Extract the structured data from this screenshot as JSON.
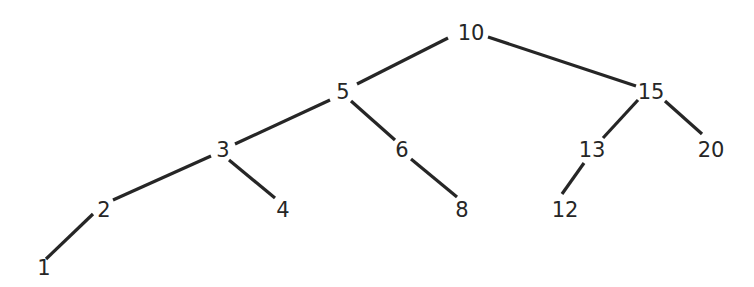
{
  "diagram": {
    "type": "binary-search-tree",
    "colors": {
      "stroke": "#262626",
      "text": "#262626",
      "background": "#ffffff"
    },
    "nodes": [
      {
        "id": "n10",
        "label": "10",
        "x": 471,
        "y": 33
      },
      {
        "id": "n5",
        "label": "5",
        "x": 343,
        "y": 92
      },
      {
        "id": "n15",
        "label": "15",
        "x": 651,
        "y": 92
      },
      {
        "id": "n3",
        "label": "3",
        "x": 223,
        "y": 150
      },
      {
        "id": "n6",
        "label": "6",
        "x": 402,
        "y": 150
      },
      {
        "id": "n13",
        "label": "13",
        "x": 592,
        "y": 150
      },
      {
        "id": "n20",
        "label": "20",
        "x": 711,
        "y": 150
      },
      {
        "id": "n2",
        "label": "2",
        "x": 104,
        "y": 210
      },
      {
        "id": "n4",
        "label": "4",
        "x": 283,
        "y": 210
      },
      {
        "id": "n8",
        "label": "8",
        "x": 462,
        "y": 210
      },
      {
        "id": "n12",
        "label": "12",
        "x": 565,
        "y": 210
      },
      {
        "id": "n1",
        "label": "1",
        "x": 44,
        "y": 268
      }
    ],
    "edges": [
      {
        "from": "n10",
        "to": "n5",
        "x1": 448,
        "y1": 38,
        "x2": 357,
        "y2": 84
      },
      {
        "from": "n10",
        "to": "n15",
        "x1": 488,
        "y1": 37,
        "x2": 636,
        "y2": 86
      },
      {
        "from": "n5",
        "to": "n3",
        "x1": 330,
        "y1": 100,
        "x2": 235,
        "y2": 144
      },
      {
        "from": "n5",
        "to": "n6",
        "x1": 351,
        "y1": 101,
        "x2": 395,
        "y2": 140
      },
      {
        "from": "n15",
        "to": "n13",
        "x1": 638,
        "y1": 100,
        "x2": 603,
        "y2": 138
      },
      {
        "from": "n15",
        "to": "n20",
        "x1": 665,
        "y1": 101,
        "x2": 702,
        "y2": 134
      },
      {
        "from": "n3",
        "to": "n2",
        "x1": 211,
        "y1": 156,
        "x2": 113,
        "y2": 200
      },
      {
        "from": "n3",
        "to": "n4",
        "x1": 229,
        "y1": 160,
        "x2": 275,
        "y2": 198
      },
      {
        "from": "n6",
        "to": "n8",
        "x1": 411,
        "y1": 159,
        "x2": 457,
        "y2": 197
      },
      {
        "from": "n13",
        "to": "n12",
        "x1": 584,
        "y1": 163,
        "x2": 562,
        "y2": 194
      },
      {
        "from": "n2",
        "to": "n1",
        "x1": 93,
        "y1": 214,
        "x2": 46,
        "y2": 259
      }
    ]
  }
}
